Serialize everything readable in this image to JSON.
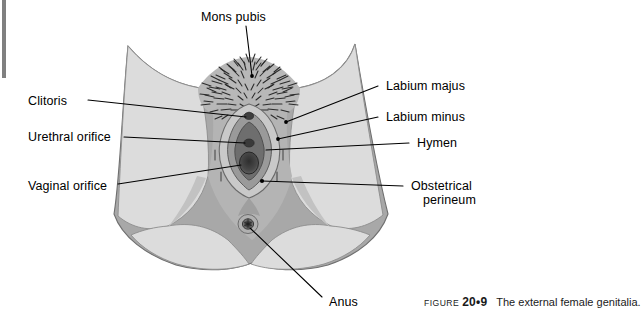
{
  "figure": {
    "alt_name": "external-female-genitalia-diagram",
    "caption": {
      "prefix": "FIGURE",
      "number": "20•9",
      "text": "The external female genitalia."
    }
  },
  "labels": {
    "mons_pubis": "Mons pubis",
    "clitoris": "Clitoris",
    "urethral_orifice": "Urethral orifice",
    "vaginal_orifice": "Vaginal orifice",
    "labium_majus": "Labium majus",
    "labium_minus": "Labium minus",
    "hymen": "Hymen",
    "obstetrical_perineum_line1": "Obstetrical",
    "obstetrical_perineum_line2": "perineum",
    "anus": "Anus"
  },
  "colors": {
    "background": "#ffffff",
    "skin_light": "#dcdcdc",
    "skin_mid": "#a8a8a8",
    "skin_shadow": "#bdbdbd",
    "labia_outer": "#c9c9c9",
    "labia_mid": "#9a9a9a",
    "labia_inner": "#6e6e6e",
    "orifice_dark": "#3a3a3a",
    "hair": "#2b2b2b",
    "outline": "#6b6b6b",
    "leader_line": "#000000",
    "edge_bar": "#808080",
    "text": "#000000"
  }
}
